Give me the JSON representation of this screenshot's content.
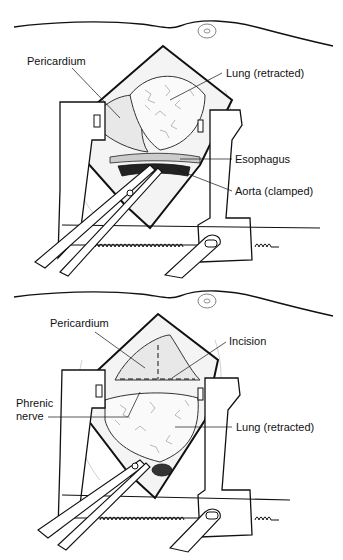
{
  "figure": {
    "panels": [
      {
        "id": "top",
        "labels": {
          "pericardium": "Pericardium",
          "lung": "Lung (retracted)",
          "esophagus": "Esophagus",
          "aorta": "Aorta (clamped)"
        }
      },
      {
        "id": "bottom",
        "labels": {
          "pericardium": "Pericardium",
          "incision": "Incision",
          "phrenic_line1": "Phrenic",
          "phrenic_line2": "nerve",
          "lung": "Lung (retracted)"
        }
      }
    ]
  }
}
